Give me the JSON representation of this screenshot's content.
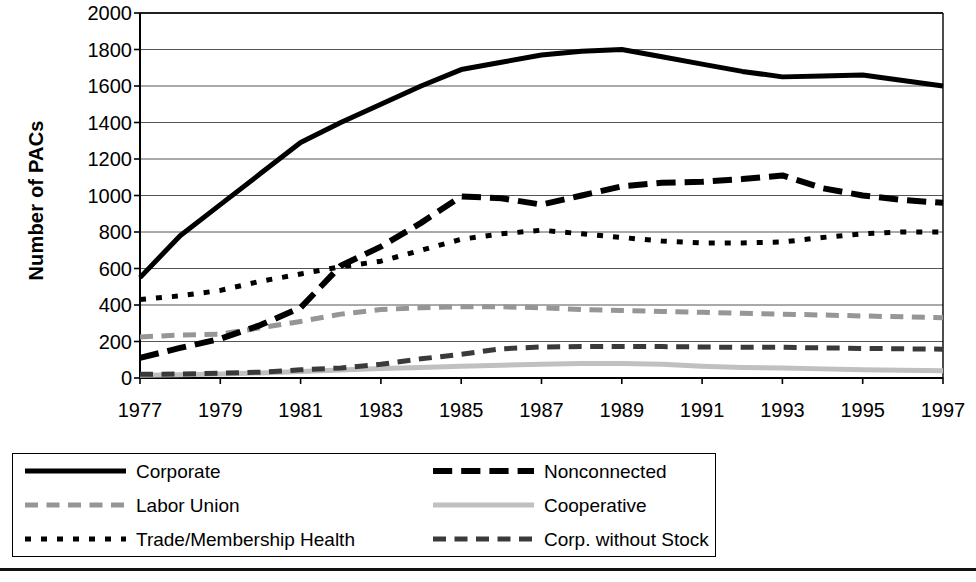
{
  "chart_data": {
    "type": "line",
    "title": "",
    "subtitle": "",
    "xlabel": "",
    "ylabel": "Number of PACs",
    "xlim": [
      1977,
      1997
    ],
    "ylim": [
      0,
      2000
    ],
    "ytick_step": 200,
    "xtick_step": 2,
    "grid": "horizontal",
    "legend_position": "bottom",
    "x": [
      1977,
      1978,
      1979,
      1980,
      1981,
      1982,
      1983,
      1984,
      1985,
      1986,
      1987,
      1988,
      1989,
      1990,
      1991,
      1992,
      1993,
      1994,
      1995,
      1996,
      1997
    ],
    "yticks": [
      "0",
      "200",
      "400",
      "600",
      "800",
      "1000",
      "1200",
      "1400",
      "1600",
      "1800",
      "2000"
    ],
    "xticks": [
      "1977",
      "1979",
      "1981",
      "1983",
      "1985",
      "1987",
      "1989",
      "1991",
      "1993",
      "1995",
      "1997"
    ],
    "series": [
      {
        "name": "Corporate",
        "color": "#000000",
        "style": "solid",
        "width": 5,
        "values": [
          550,
          780,
          950,
          1120,
          1290,
          1400,
          1500,
          1600,
          1690,
          1730,
          1770,
          1790,
          1800,
          1760,
          1720,
          1680,
          1650,
          1655,
          1660,
          1630,
          1600
        ]
      },
      {
        "name": "Trade/Membership Health",
        "color": "#000000",
        "style": "dotted",
        "width": 5,
        "values": [
          430,
          450,
          480,
          530,
          570,
          610,
          640,
          700,
          760,
          790,
          810,
          790,
          770,
          750,
          740,
          740,
          745,
          770,
          790,
          800,
          800
        ]
      },
      {
        "name": "Cooperative",
        "color": "#c0c0c0",
        "style": "solid",
        "width": 5,
        "values": [
          15,
          18,
          22,
          28,
          35,
          44,
          52,
          58,
          65,
          70,
          75,
          80,
          80,
          75,
          65,
          58,
          55,
          50,
          45,
          42,
          40
        ]
      },
      {
        "name": "Labor Union",
        "color": "#969696",
        "style": "dashdot",
        "width": 5,
        "values": [
          225,
          235,
          240,
          275,
          310,
          350,
          375,
          385,
          390,
          390,
          385,
          375,
          370,
          365,
          360,
          355,
          350,
          345,
          340,
          335,
          330
        ]
      },
      {
        "name": "Nonconnected",
        "color": "#000000",
        "style": "longdash",
        "width": 6,
        "values": [
          110,
          165,
          215,
          290,
          385,
          615,
          720,
          850,
          995,
          985,
          950,
          1000,
          1050,
          1070,
          1075,
          1090,
          1110,
          1040,
          1000,
          975,
          960
        ]
      },
      {
        "name": "Corp. without Stock",
        "color": "#3a3a3a",
        "style": "dashdot",
        "width": 5,
        "values": [
          20,
          22,
          26,
          32,
          45,
          55,
          75,
          105,
          130,
          160,
          170,
          172,
          172,
          172,
          170,
          168,
          168,
          165,
          162,
          160,
          158
        ]
      }
    ]
  },
  "legend": {
    "entries": [
      {
        "label": "Corporate",
        "swatch": "legend-swatch-corporate"
      },
      {
        "label": "Labor Union",
        "swatch": "legend-swatch-labor-union"
      },
      {
        "label": "Trade/Membership Health",
        "swatch": "legend-swatch-trade-membership-health"
      },
      {
        "label": "Nonconnected",
        "swatch": "legend-swatch-nonconnected"
      },
      {
        "label": "Cooperative",
        "swatch": "legend-swatch-cooperative"
      },
      {
        "label": "Corp. without Stock",
        "swatch": "legend-swatch-corp-without-stock"
      }
    ]
  }
}
